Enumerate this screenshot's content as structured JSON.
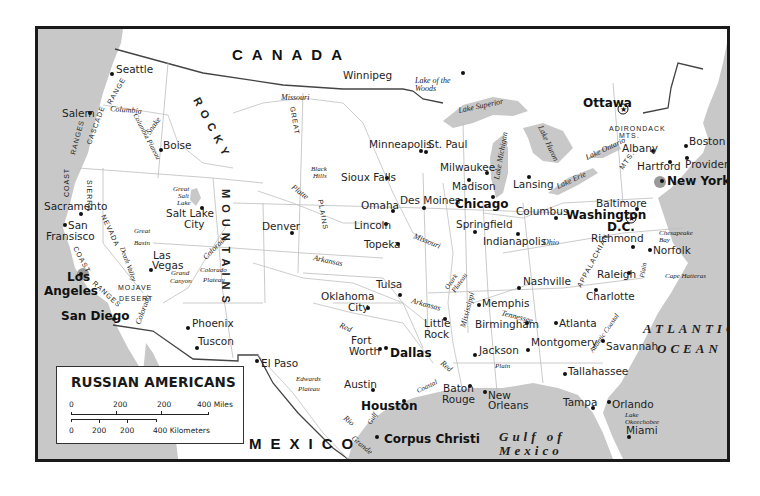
{
  "map": {
    "title": "RUSSIAN AMERICANS",
    "colors": {
      "water": "#c8c8c8",
      "land": "#ffffff",
      "frame": "#1a1a1a",
      "text": "#1e1e1e"
    },
    "countries": [
      "CANADA",
      "MEXICO"
    ],
    "oceans": {
      "atlantic_1": "ATLANTIC",
      "atlantic_2": "OCEAN",
      "gulf_1": "Gulf of",
      "gulf_2": "Mexico"
    },
    "cities": {
      "seattle": "Seattle",
      "salem": "Salem",
      "boise": "Boise",
      "sacramento": "Sacramento",
      "san_francisco_1": "San",
      "san_francisco_2": "Fransisco",
      "los_angeles_1": "Los",
      "los_angeles_2": "Angeles",
      "san_diego": "San Diego",
      "las_vegas_1": "Las",
      "las_vegas_2": "Vegas",
      "salt_lake_city_1": "Salt Lake",
      "salt_lake_city_2": "City",
      "phoenix": "Phoenix",
      "tuscon": "Tuscon",
      "el_paso": "El Paso",
      "denver": "Denver",
      "winnipeg": "Winnipeg",
      "minneapolis": "Minneapolis",
      "st_paul": "St. Paul",
      "sioux_falls": "Sioux Falls",
      "omaha": "Omaha",
      "lincoln": "Lincoln",
      "topeka": "Topeka",
      "des_moines": "Des Moines",
      "oklahoma_city_1": "Oklahoma",
      "oklahoma_city_2": "City",
      "tulsa": "Tulsa",
      "fort_worth_1": "Fort",
      "fort_worth_2": "Worth",
      "dallas": "Dallas",
      "austin": "Austin",
      "houston": "Houston",
      "corpus_christi": "Corpus Christi",
      "little_rock_1": "Little",
      "little_rock_2": "Rock",
      "memphis": "Memphis",
      "jackson": "Jackson",
      "baton_rouge_1": "Baton",
      "baton_rouge_2": "Rouge",
      "new_orleans_1": "New",
      "new_orleans_2": "Orleans",
      "milwaukee": "Milwaukee",
      "madison": "Madison",
      "chicago": "Chicago",
      "springfield": "Springfield",
      "indianapolis": "Indianapolis",
      "lansing": "Lansing",
      "columbus": "Columbus",
      "nashville": "Nashville",
      "birmingham": "Birmingham",
      "atlanta": "Atlanta",
      "montgomery": "Montgomery",
      "tallahassee": "Tallahassee",
      "tampa": "Tampa",
      "orlando": "Orlando",
      "miami": "Miami",
      "savannah": "Savannah",
      "charlotte": "Charlotte",
      "raleigh": "Raleigh",
      "richmond": "Richmond",
      "norfolk": "Norfolk",
      "washington_1": "Washington",
      "washington_2": "D.C.",
      "baltimore": "Baltimore",
      "new_york": "New York",
      "hartford": "Hartford",
      "providence": "Providence",
      "boston": "Boston",
      "albany": "Albany",
      "ottawa": "Ottawa"
    },
    "features": {
      "lake_of_the_woods_1": "Lake of the",
      "lake_of_the_woods_2": "Woods",
      "lake_superior": "Lake Superior",
      "lake_michigan": "Lake Michigan",
      "lake_huron": "Lake Huron",
      "lake_erie": "Lake Erie",
      "lake_ontario": "Lake Ontario",
      "great_salt_lake_1": "Great",
      "great_salt_lake_2": "Salt",
      "great_salt_lake_3": "Lake",
      "great_basin_1": "Great",
      "great_basin_2": "Basin",
      "death_valley": "Death Valley",
      "mojave_1": "MOJAVE",
      "mojave_2": "DESERT",
      "grand_canyon_1": "Grand",
      "grand_canyon_2": "Canyon",
      "colorado_plateau_1": "Colorado",
      "colorado_plateau_2": "Plateau",
      "columbia_plateau": "Columbia Plateau",
      "black_hills_1": "Black",
      "black_hills_2": "Hills",
      "edwards_plateau_1": "Edwards",
      "edwards_plateau_2": "Plateau",
      "ozark_plateau_1": "Ozark",
      "ozark_plateau_2": "Plateau",
      "chesapeake_1": "Chesapeake",
      "chesapeake_2": "Bay",
      "cape_hatteras": "Cape Hatteras",
      "lake_okeechobee_1": "Lake",
      "lake_okeechobee_2": "Okeechobee",
      "adirondack_1": "ADIRONDACK",
      "adirondack_2": "MTS.",
      "appalachian": "APPALACHIAN",
      "appalachian_mts": "MTS.",
      "atlantic_coastal_plain_1": "Atlantic Coastal",
      "atlantic_coastal_plain_2": "Plain",
      "gulf_coastal_plain_1": "Gulf",
      "gulf_coastal_plain_2": "Coastal",
      "gulf_coastal_plain_3": "Plain",
      "rocky": "ROCKY",
      "mountains": "MOUNTAINS",
      "great": "GREAT",
      "plains": "PLAINS",
      "cascade": "CASCADE",
      "cascade_range": "RANGE",
      "coast": "COAST",
      "ranges": "RANGES",
      "ranges_2": "RANGES",
      "coast_2": "COAST",
      "sierra": "SIERRA",
      "nevada": "NEVADA"
    },
    "rivers": {
      "columbia": "Columbia",
      "snake": "Snake",
      "missouri_1": "Missouri",
      "missouri_2": "Missouri",
      "platte": "Platte",
      "arkansas_1": "Arkansas",
      "arkansas_2": "Arkansas",
      "colorado_1": "Colorado",
      "colorado_2": "Colorado",
      "red_1": "Red",
      "red_2": "Red",
      "rio_grande_1": "Rio",
      "rio_grande_2": "Grande",
      "mississippi": "Mississippi",
      "ohio": "Ohio",
      "tennessee": "Tennessee"
    },
    "legend": {
      "miles_ticks": [
        "0",
        "200",
        "200",
        "400 Miles"
      ],
      "km_ticks": [
        "0",
        "200",
        "200",
        "400 Kilometers"
      ]
    }
  }
}
